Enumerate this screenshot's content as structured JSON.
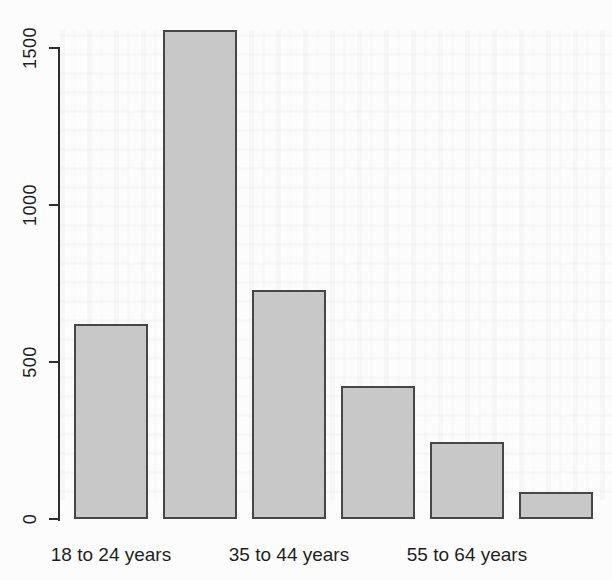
{
  "chart_data": {
    "type": "bar",
    "title": "",
    "xlabel": "",
    "ylabel": "",
    "categories": [
      "18 to 24 years",
      "",
      "35 to 44 years",
      "",
      "55 to 64 years",
      ""
    ],
    "values": [
      620,
      1560,
      730,
      425,
      245,
      85
    ],
    "visible_x_labels": [
      "18 to 24 years",
      "35 to 44 years",
      "55 to 64 years"
    ],
    "yticks": [
      0,
      500,
      1000,
      1500
    ],
    "ylim": [
      0,
      1600
    ],
    "grid": false,
    "legend": "none",
    "colors": {
      "bar_fill": "#c8c8c8",
      "bar_border": "#474747",
      "axis": "#2e2e2e",
      "text": "#1f1f1f",
      "background": "#fcfcfc"
    }
  }
}
